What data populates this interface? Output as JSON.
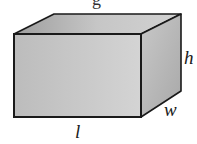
{
  "diagram": {
    "type": "rectangular-prism",
    "title_partial": "g",
    "labels": {
      "length": "l",
      "width": "w",
      "height": "h"
    },
    "colors": {
      "front_face": "#c4c4c4",
      "top_face": "#bdbdbd",
      "side_face": "#b0b0b0",
      "edge": "#1a1a1a",
      "background": "#ffffff"
    }
  }
}
